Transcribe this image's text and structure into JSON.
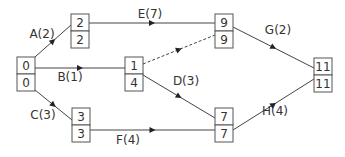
{
  "diagram": {
    "type": "activity-on-arrow network",
    "nodes": [
      {
        "id": "n0",
        "earliest": "0",
        "latest": "0"
      },
      {
        "id": "n1",
        "earliest": "2",
        "latest": "2"
      },
      {
        "id": "n2",
        "earliest": "1",
        "latest": "4"
      },
      {
        "id": "n3",
        "earliest": "3",
        "latest": "3"
      },
      {
        "id": "n4",
        "earliest": "9",
        "latest": "9"
      },
      {
        "id": "n5",
        "earliest": "7",
        "latest": "7"
      },
      {
        "id": "n6",
        "earliest": "11",
        "latest": "11"
      }
    ],
    "edges": [
      {
        "id": "A",
        "from": "n0",
        "to": "n1",
        "label": "A(2)",
        "dummy": false
      },
      {
        "id": "B",
        "from": "n0",
        "to": "n2",
        "label": "B(1)",
        "dummy": false
      },
      {
        "id": "C",
        "from": "n0",
        "to": "n3",
        "label": "C(3)",
        "dummy": false
      },
      {
        "id": "E",
        "from": "n1",
        "to": "n4",
        "label": "E(7)",
        "dummy": false
      },
      {
        "id": "dummy",
        "from": "n2",
        "to": "n4",
        "label": "",
        "dummy": true
      },
      {
        "id": "D",
        "from": "n2",
        "to": "n5",
        "label": "D(3)",
        "dummy": false
      },
      {
        "id": "F",
        "from": "n3",
        "to": "n5",
        "label": "F(4)",
        "dummy": false
      },
      {
        "id": "G",
        "from": "n4",
        "to": "n6",
        "label": "G(2)",
        "dummy": false
      },
      {
        "id": "H",
        "from": "n5",
        "to": "n6",
        "label": "H(4)",
        "dummy": false
      }
    ]
  }
}
